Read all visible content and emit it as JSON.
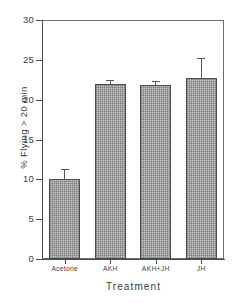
{
  "chart_data": {
    "type": "bar",
    "title": "",
    "subtitle": "",
    "xlabel": "Treatment",
    "ylabel": "% Flying > 20 min",
    "categories": [
      "Acetone",
      "AKH",
      "AKH+JH",
      "JH"
    ],
    "values": [
      10.0,
      22.0,
      21.9,
      22.7
    ],
    "errors": [
      1.3,
      0.5,
      0.5,
      2.5
    ],
    "series": [
      {
        "name": "% Flying > 20 min",
        "values": [
          10.0,
          22.0,
          21.9,
          22.7
        ],
        "errors": [
          1.3,
          0.5,
          0.5,
          2.5
        ]
      }
    ],
    "ylim": [
      0,
      30
    ],
    "yticks": [
      0,
      5,
      10,
      15,
      20,
      25,
      30
    ],
    "ytick_labels": [
      "0",
      "5",
      "10",
      "15",
      "20",
      "25",
      "30"
    ],
    "xlim_categories": 4,
    "grid": false,
    "legend": false,
    "legend_position": "none",
    "error_bar_style": "upper-only",
    "bar_fill": "#c9c9c9",
    "bar_edge": "#4d4d4d",
    "axis_color": "#4a4a4a",
    "background": "#ffffff"
  },
  "axes": {
    "y_tick_labels": [
      "30",
      "25",
      "20",
      "15",
      "10",
      "5",
      "0"
    ],
    "y_title": "% Flying > 20 min",
    "x_title": "Treatment",
    "x_tick_labels": [
      "Acetone",
      "AKH",
      "AKH+JH",
      "JH"
    ]
  }
}
